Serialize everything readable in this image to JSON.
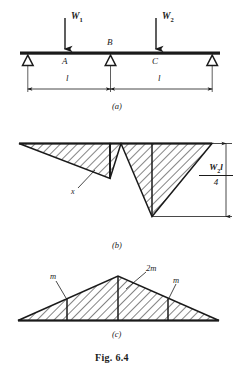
{
  "figure": {
    "caption": "Fig. 6.4",
    "panels": [
      {
        "tag": "(a)",
        "name": "beam-loading-diagram"
      },
      {
        "tag": "(b)",
        "name": "bending-moment-diagram"
      },
      {
        "tag": "(c)",
        "name": "collapse-mechanism-diagram"
      }
    ]
  },
  "panel_a": {
    "loads": [
      {
        "label": "W",
        "subscript": "1"
      },
      {
        "label": "W",
        "subscript": "2"
      }
    ],
    "points": [
      "A",
      "B",
      "C"
    ],
    "spans": [
      "l",
      "l"
    ],
    "support_count": 3,
    "icon": "pin-support-triangle"
  },
  "panel_b": {
    "ordinate_label": {
      "numerator": "W",
      "numerator_sub": "2",
      "numerator_tail": "l",
      "denominator": "4"
    },
    "dimension_label": "x",
    "hatch": "diagonal-hatch"
  },
  "panel_c": {
    "moment_labels": [
      "m",
      "2m",
      "m"
    ],
    "hatch": "diagonal-hatch"
  },
  "colors": {
    "ink": "#1a1a1a",
    "paper": "#ffffff",
    "hatch": "#2a2a2a"
  }
}
